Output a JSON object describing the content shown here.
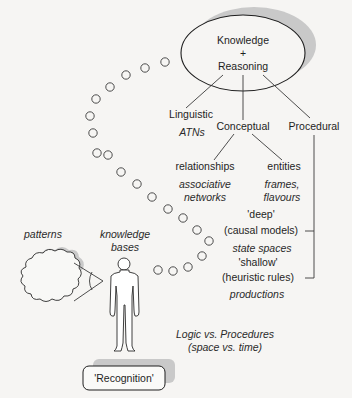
{
  "diagram": {
    "root": {
      "line1": "Knowledge",
      "line2": "+",
      "line3": "Reasoning"
    },
    "branches": {
      "linguistic": {
        "label": "Linguistic",
        "example": "ATNs"
      },
      "conceptual": {
        "label": "Conceptual"
      },
      "procedural": {
        "label": "Procedural"
      }
    },
    "conceptual_children": {
      "relationships": {
        "label": "relationships",
        "example_line1": "associative",
        "example_line2": "networks"
      },
      "entities": {
        "label": "entities",
        "example_line1": "frames,",
        "example_line2": "flavours"
      }
    },
    "procedural_children": {
      "deep": {
        "label_line1": "'deep'",
        "label_line2": "(causal models)",
        "example": "state spaces"
      },
      "shallow": {
        "label_line1": "'shallow'",
        "label_line2": "(heuristic rules)",
        "example": "productions"
      }
    },
    "left_side": {
      "patterns": "patterns",
      "knowledge_bases_line1": "knowledge",
      "knowledge_bases_line2": "bases"
    },
    "footer_note": {
      "line1": "Logic vs. Procedures",
      "line2": "(space vs. time)"
    },
    "recognition_box": "'Recognition'",
    "icons": {
      "thought_cloud": "cloud-icon",
      "person": "person-icon",
      "trail": "circle-dot-trail"
    }
  }
}
